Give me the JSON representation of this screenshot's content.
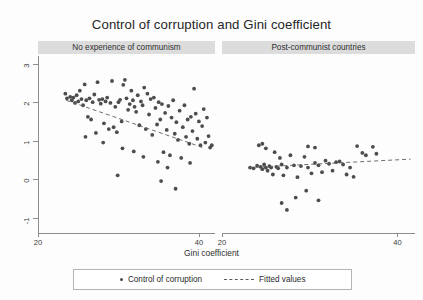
{
  "title": "Control of corruption and Gini coefficient",
  "axis": {
    "x_title": "Gini coefficient",
    "x_ticks": [
      "20",
      "40"
    ],
    "y_ticks": [
      "3",
      "2",
      "1",
      "0",
      "-1"
    ]
  },
  "panels": [
    {
      "key": "left",
      "header": "No experience of communism"
    },
    {
      "key": "right",
      "header": "Post-communist countries"
    }
  ],
  "legend": {
    "scatter_label": "Control of corruption",
    "fit_label": "Fitted values",
    "dot_icon": "filled-circle-marker",
    "line_icon": "dashed-line-marker"
  },
  "colors": {
    "point": "#4d4d4d",
    "fit_line": "#5c5c5c",
    "axis": "#8d8d8d",
    "strip_bg": "#dcdcdc",
    "text": "#2b2b2b",
    "background": "#fdfdfd"
  },
  "chart_data": {
    "type": "scatter",
    "title": "Control of corruption and Gini coefficient",
    "xlabel": "Gini coefficient",
    "ylabel": "Control of corruption",
    "xlim": [
      20,
      42
    ],
    "ylim": [
      -1.4,
      3.2
    ],
    "grid": false,
    "legend_position": "bottom",
    "facets": [
      {
        "name": "No experience of communism",
        "xlim": [
          20,
          42
        ],
        "ylim": [
          -1.4,
          3.2
        ],
        "fit": {
          "x": [
            23.5,
            40.5
          ],
          "y": [
            2.05,
            0.82
          ]
        },
        "points": [
          [
            23.4,
            2.22
          ],
          [
            23.6,
            2.1
          ],
          [
            24.0,
            2.14
          ],
          [
            24.2,
            2.05
          ],
          [
            24.4,
            2.12
          ],
          [
            24.6,
            1.98
          ],
          [
            24.8,
            2.18
          ],
          [
            25.0,
            2.02
          ],
          [
            25.2,
            2.3
          ],
          [
            25.4,
            2.08
          ],
          [
            25.6,
            1.92
          ],
          [
            25.8,
            2.46
          ],
          [
            26.0,
            2.05
          ],
          [
            26.2,
            1.62
          ],
          [
            26.4,
            2.1
          ],
          [
            26.6,
            1.55
          ],
          [
            26.8,
            2.0
          ],
          [
            27.0,
            2.2
          ],
          [
            27.4,
            2.52
          ],
          [
            27.6,
            2.06
          ],
          [
            27.8,
            1.96
          ],
          [
            28.0,
            2.08
          ],
          [
            28.2,
            1.45
          ],
          [
            28.4,
            2.02
          ],
          [
            28.6,
            2.12
          ],
          [
            28.8,
            1.3
          ],
          [
            29.0,
            1.98
          ],
          [
            29.2,
            2.55
          ],
          [
            29.4,
            1.35
          ],
          [
            29.6,
            1.88
          ],
          [
            29.8,
            1.22
          ],
          [
            30.0,
            2.0
          ],
          [
            30.2,
            2.06
          ],
          [
            30.4,
            1.5
          ],
          [
            30.6,
            2.45
          ],
          [
            30.8,
            2.58
          ],
          [
            31.0,
            2.1
          ],
          [
            31.2,
            1.8
          ],
          [
            31.4,
            1.95
          ],
          [
            31.6,
            2.3
          ],
          [
            31.8,
            2.05
          ],
          [
            32.0,
            1.88
          ],
          [
            32.2,
            1.75
          ],
          [
            32.4,
            2.18
          ],
          [
            32.6,
            1.4
          ],
          [
            32.8,
            2.02
          ],
          [
            33.0,
            1.92
          ],
          [
            33.2,
            2.38
          ],
          [
            33.4,
            1.3
          ],
          [
            33.6,
            2.22
          ],
          [
            33.8,
            1.68
          ],
          [
            34.0,
            2.08
          ],
          [
            34.2,
            1.15
          ],
          [
            34.4,
            2.12
          ],
          [
            34.6,
            1.85
          ],
          [
            34.8,
            1.42
          ],
          [
            35.0,
            2.0
          ],
          [
            35.2,
            1.55
          ],
          [
            35.4,
            1.95
          ],
          [
            35.6,
            0.7
          ],
          [
            35.8,
            1.72
          ],
          [
            36.0,
            1.28
          ],
          [
            36.2,
            1.9
          ],
          [
            36.4,
            0.62
          ],
          [
            36.6,
            1.6
          ],
          [
            36.8,
            2.05
          ],
          [
            37.0,
            1.18
          ],
          [
            37.2,
            1.48
          ],
          [
            37.4,
            1.02
          ],
          [
            37.6,
            1.78
          ],
          [
            37.8,
            0.55
          ],
          [
            38.0,
            1.35
          ],
          [
            38.2,
            1.92
          ],
          [
            38.4,
            1.1
          ],
          [
            38.6,
            1.55
          ],
          [
            38.8,
            0.92
          ],
          [
            39.0,
            1.62
          ],
          [
            39.2,
            1.25
          ],
          [
            39.4,
            2.35
          ],
          [
            39.6,
            1.7
          ],
          [
            39.8,
            1.05
          ],
          [
            40.0,
            1.5
          ],
          [
            40.2,
            0.88
          ],
          [
            40.4,
            1.38
          ],
          [
            40.6,
            1.82
          ],
          [
            40.8,
            0.95
          ],
          [
            41.0,
            1.6
          ],
          [
            41.2,
            1.12
          ],
          [
            41.4,
            0.82
          ],
          [
            41.6,
            0.88
          ],
          [
            29.9,
            0.1
          ],
          [
            35.3,
            -0.05
          ],
          [
            37.1,
            -0.25
          ],
          [
            36.1,
            0.3
          ],
          [
            38.9,
            0.42
          ],
          [
            33.1,
            0.58
          ],
          [
            31.9,
            0.72
          ],
          [
            30.5,
            0.8
          ],
          [
            27.2,
            1.2
          ],
          [
            25.9,
            1.1
          ],
          [
            28.1,
            0.95
          ],
          [
            34.9,
            0.45
          ]
        ]
      },
      {
        "name": "Post-communist countries",
        "xlim": [
          20,
          42
        ],
        "ylim": [
          -1.4,
          3.2
        ],
        "fit": {
          "x": [
            23.0,
            41.5
          ],
          "y": [
            0.3,
            0.52
          ]
        },
        "points": [
          [
            23.2,
            0.3
          ],
          [
            23.6,
            0.28
          ],
          [
            24.0,
            0.35
          ],
          [
            24.4,
            0.32
          ],
          [
            24.6,
            0.26
          ],
          [
            24.8,
            0.38
          ],
          [
            25.0,
            0.3
          ],
          [
            25.2,
            0.22
          ],
          [
            25.4,
            0.34
          ],
          [
            25.6,
            0.3
          ],
          [
            25.8,
            0.12
          ],
          [
            26.0,
            0.7
          ],
          [
            26.2,
            0.32
          ],
          [
            26.4,
            0.28
          ],
          [
            26.6,
            0.55
          ],
          [
            26.8,
            0.38
          ],
          [
            27.0,
            0.1
          ],
          [
            27.4,
            0.3
          ],
          [
            27.8,
            0.62
          ],
          [
            28.2,
            0.36
          ],
          [
            28.6,
            0.05
          ],
          [
            29.0,
            0.34
          ],
          [
            29.4,
            0.58
          ],
          [
            29.8,
            0.3
          ],
          [
            30.2,
            0.15
          ],
          [
            30.6,
            0.42
          ],
          [
            31.0,
            0.36
          ],
          [
            31.4,
            0.18
          ],
          [
            31.8,
            0.48
          ],
          [
            32.2,
            0.4
          ],
          [
            32.6,
            0.22
          ],
          [
            33.0,
            0.44
          ],
          [
            33.4,
            0.46
          ],
          [
            33.8,
            0.38
          ],
          [
            34.2,
            0.12
          ],
          [
            34.6,
            0.3
          ],
          [
            35.0,
            0.06
          ],
          [
            36.0,
            0.68
          ],
          [
            36.4,
            0.62
          ],
          [
            37.6,
            0.66
          ],
          [
            24.2,
            0.88
          ],
          [
            24.6,
            0.92
          ],
          [
            25.0,
            0.8
          ],
          [
            29.8,
            0.85
          ],
          [
            30.6,
            0.82
          ],
          [
            35.4,
            0.86
          ],
          [
            37.2,
            0.84
          ],
          [
            26.8,
            -0.62
          ],
          [
            28.4,
            -0.48
          ],
          [
            29.6,
            -0.3
          ],
          [
            27.4,
            -0.8
          ],
          [
            31.0,
            -0.55
          ]
        ]
      }
    ]
  }
}
